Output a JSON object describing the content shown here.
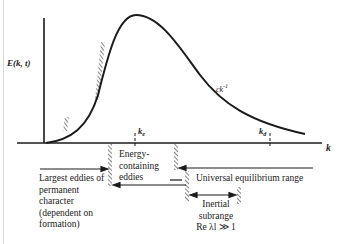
{
  "diagram": {
    "type": "energy-spectrum",
    "y_axis_label": "E(k, t)",
    "x_axis_label": "k",
    "curve_annotation": {
      "base": "ck",
      "exponent": "-1"
    },
    "ticks": [
      {
        "id": "ke",
        "label": "k",
        "subscript": "e"
      },
      {
        "id": "kd",
        "label": "k",
        "subscript": "d"
      }
    ],
    "ranges": [
      {
        "id": "largest",
        "lines": [
          "Largest eddies of",
          "permanent",
          "character",
          "(dependent on",
          "formation)"
        ]
      },
      {
        "id": "energy",
        "lines": [
          "Energy-",
          "containing",
          "eddies"
        ]
      },
      {
        "id": "universal",
        "lines": [
          "Universal equilibrium range"
        ]
      },
      {
        "id": "inertial",
        "lines": [
          "Inertial",
          "subrange",
          "Re λl ≫ 1"
        ]
      }
    ],
    "colors": {
      "ink": "#1a1a1a",
      "background": "#ffffff"
    }
  }
}
